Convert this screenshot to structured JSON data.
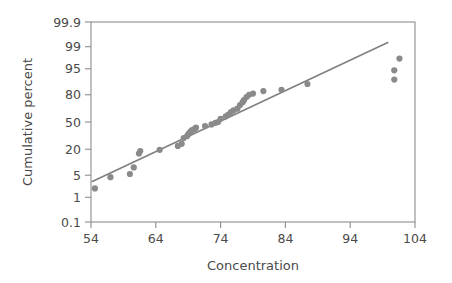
{
  "chart_data": {
    "type": "scatter",
    "title": "",
    "subtitle": "",
    "xlabel": "Concentration",
    "ylabel": "Cumulative percent",
    "grid": false,
    "legend": null,
    "xscale": "linear",
    "yscale": "normal-probability",
    "xlim": [
      54,
      104
    ],
    "ylim": [
      0.1,
      99.9
    ],
    "xticks": [
      54,
      64,
      74,
      84,
      94,
      104
    ],
    "xticklabels": [
      "54",
      "64",
      "74",
      "84",
      "94",
      "104"
    ],
    "yticks": [
      99.9,
      99,
      95,
      80,
      50,
      20,
      5,
      1,
      0.1
    ],
    "yticklabels": [
      "99.9",
      "99",
      "95",
      "80",
      "50",
      "20",
      "5",
      "1",
      "0.1"
    ],
    "series": [
      {
        "name": "observations",
        "type": "scatter",
        "marker": "circle",
        "color": "#8a8a8a",
        "x": [
          54.6,
          57.0,
          60.0,
          60.6,
          61.4,
          61.6,
          64.6,
          67.4,
          68.0,
          68.3,
          68.8,
          69.0,
          69.2,
          69.4,
          69.6,
          70.0,
          70.2,
          71.6,
          72.6,
          73.2,
          73.6,
          74.0,
          74.8,
          75.2,
          75.6,
          76.0,
          76.6,
          77.0,
          77.4,
          77.6,
          78.0,
          78.4,
          79.0,
          80.6,
          83.4,
          87.4,
          100.8,
          100.8,
          101.6
        ],
        "y": [
          2.0,
          4.4,
          5.4,
          8.0,
          16.5,
          18.5,
          19.5,
          23.0,
          25.0,
          31.0,
          33.0,
          35.0,
          37.0,
          38.5,
          40.0,
          41.5,
          43.0,
          45.0,
          47.0,
          49.0,
          50.0,
          54.0,
          57.0,
          59.0,
          62.0,
          64.0,
          66.0,
          70.0,
          73.0,
          75.0,
          78.0,
          80.0,
          81.0,
          83.0,
          84.0,
          88.0,
          90.5,
          94.5,
          97.5
        ]
      },
      {
        "name": "reference-line",
        "type": "line",
        "color": "#807f7f",
        "x": [
          54.2,
          99.8
        ],
        "y": [
          3.3,
          99.3
        ]
      }
    ]
  }
}
